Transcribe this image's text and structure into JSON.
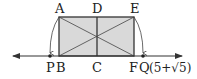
{
  "diagram": {
    "colors": {
      "fill": "#d9d9d9",
      "stroke": "#333333",
      "text": "#222222"
    },
    "points": {
      "A": {
        "label": "A",
        "x": 59,
        "y": 17
      },
      "D": {
        "label": "D",
        "x": 97,
        "y": 17
      },
      "E": {
        "label": "E",
        "x": 134,
        "y": 17
      },
      "B": {
        "label": "B",
        "x": 59,
        "y": 56
      },
      "C": {
        "label": "C",
        "x": 97,
        "y": 56
      },
      "F": {
        "label": "F",
        "x": 134,
        "y": 56
      },
      "P": {
        "label": "P",
        "x": 50,
        "y": 56
      },
      "Q": {
        "label": "Q",
        "x": 143,
        "y": 56
      }
    },
    "q_coordinate": "(5+√5)",
    "number_line": {
      "x_start": 12,
      "x_end": 183,
      "y": 56
    }
  }
}
